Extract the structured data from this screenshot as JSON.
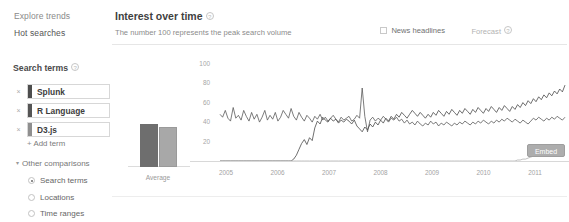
{
  "sidebar": {
    "nav": [
      {
        "label": "Explore trends",
        "name": "explore-trends"
      },
      {
        "label": "Hot searches",
        "name": "hot-searches"
      }
    ],
    "search_terms_heading": "Search terms",
    "help_glyph": "?",
    "remove_glyph": "×",
    "terms": [
      {
        "label": "Splunk",
        "color": "#4d4d4d"
      },
      {
        "label": "R Language",
        "color": "#555555"
      },
      {
        "label": "D3.js",
        "color": "#8f8f8f"
      }
    ],
    "add_term_label": "Add term",
    "add_term_plus": "+",
    "other_comparisons_label": "Other comparisons",
    "caret_glyph": "▾",
    "comparison_options": [
      {
        "label": "Search terms",
        "selected": true
      },
      {
        "label": "Locations",
        "selected": false
      },
      {
        "label": "Time ranges",
        "selected": false
      }
    ]
  },
  "main": {
    "title": "Interest over time",
    "subtitle": "The number 100 represents the peak search volume",
    "news_headlines_label": "News headlines",
    "news_headlines_checked": false,
    "forecast_label": "Forecast",
    "embed_label": "Embed"
  },
  "chart_data": {
    "type": "line",
    "title": "Interest over time",
    "subtitle": "The number 100 represents the peak search volume",
    "xlabel": "",
    "ylabel": "",
    "ylim": [
      0,
      110
    ],
    "yticks": [
      100,
      80,
      60,
      40,
      20
    ],
    "xticks": [
      "2005",
      "2006",
      "2007",
      "2008",
      "2009",
      "2010",
      "2011"
    ],
    "grid": false,
    "legend": "none",
    "average_bars": {
      "label": "Average",
      "categories": [
        "R Language",
        "Splunk"
      ],
      "values": [
        44,
        41
      ],
      "colors": [
        "#6e6e6e",
        "#a8a8a8"
      ]
    },
    "series": [
      {
        "name": "R Language",
        "color": "#5a5a5a",
        "values": [
          48,
          45,
          52,
          44,
          41,
          55,
          44,
          47,
          42,
          52,
          46,
          41,
          50,
          43,
          48,
          40,
          45,
          52,
          42,
          47,
          43,
          50,
          41,
          45,
          52,
          48,
          44,
          54,
          46,
          42,
          50,
          45,
          41,
          47,
          44,
          40,
          46,
          43,
          48,
          42,
          45,
          41,
          44,
          47,
          43,
          40,
          45,
          42,
          44,
          46,
          41,
          43,
          47,
          44,
          75,
          46,
          30,
          42,
          45,
          41,
          44,
          42,
          46,
          43,
          40,
          44,
          42,
          45,
          41,
          43,
          39,
          42,
          38,
          40,
          37,
          41,
          38,
          36,
          39,
          37,
          41,
          38,
          40,
          36,
          39,
          37,
          40,
          38,
          36,
          39,
          37,
          40,
          38,
          41,
          39,
          37,
          40,
          38,
          41,
          39,
          42,
          40,
          38,
          41,
          39,
          42,
          40,
          43,
          41,
          44,
          42,
          40,
          43,
          41,
          39,
          42,
          40,
          38,
          41,
          44,
          42,
          45,
          43,
          41,
          44,
          42,
          45,
          43,
          46,
          44,
          42,
          45
        ]
      },
      {
        "name": "Splunk",
        "color": "#4a4a4a",
        "values": [
          0,
          0,
          0,
          0,
          0,
          0,
          0,
          0,
          0,
          0,
          0,
          0,
          0,
          0,
          0,
          0,
          0,
          0,
          0,
          0,
          0,
          0,
          0,
          0,
          0,
          0,
          0,
          0,
          2,
          6,
          12,
          18,
          22,
          17,
          24,
          21,
          34,
          41,
          38,
          45,
          42,
          40,
          44,
          41,
          43,
          39,
          42,
          40,
          43,
          41,
          38,
          42,
          36,
          33,
          30,
          35,
          32,
          38,
          35,
          40,
          37,
          42,
          39,
          44,
          41,
          46,
          43,
          48,
          45,
          50,
          47,
          44,
          48,
          52,
          49,
          46,
          50,
          47,
          44,
          48,
          45,
          50,
          47,
          52,
          49,
          46,
          51,
          48,
          53,
          50,
          47,
          52,
          49,
          54,
          51,
          48,
          53,
          50,
          55,
          52,
          49,
          54,
          51,
          56,
          53,
          50,
          55,
          52,
          57,
          54,
          51,
          56,
          53,
          58,
          55,
          60,
          57,
          62,
          59,
          64,
          61,
          66,
          63,
          68,
          65,
          70,
          67,
          72,
          69,
          74,
          71,
          78
        ]
      },
      {
        "name": "D3.js",
        "color": "#b0b0b0",
        "values": [
          0,
          0,
          0,
          0,
          0,
          0,
          0,
          0,
          0,
          0,
          0,
          0,
          0,
          0,
          0,
          0,
          0,
          0,
          0,
          0,
          0,
          0,
          0,
          0,
          0,
          0,
          0,
          0,
          0,
          0,
          0,
          0,
          0,
          0,
          0,
          0,
          0,
          0,
          0,
          0,
          0,
          0,
          0,
          0,
          0,
          0,
          0,
          0,
          0,
          0,
          0,
          0,
          0,
          0,
          0,
          0,
          0,
          0,
          0,
          0,
          0,
          0,
          0,
          0,
          0,
          0,
          0,
          0,
          0,
          0,
          0,
          0,
          0,
          0,
          0,
          0,
          0,
          0,
          0,
          0,
          0,
          0,
          0,
          0,
          0,
          0,
          0,
          0,
          0,
          0,
          0,
          0,
          0,
          0,
          0,
          0,
          0,
          0,
          0,
          0,
          0,
          0,
          0,
          0,
          0,
          0,
          0,
          0,
          0,
          0,
          0,
          0,
          0,
          1,
          1,
          2,
          2,
          3,
          4,
          5,
          6,
          6,
          7,
          7,
          7,
          8,
          8,
          8,
          8,
          9,
          9,
          9
        ]
      }
    ]
  }
}
